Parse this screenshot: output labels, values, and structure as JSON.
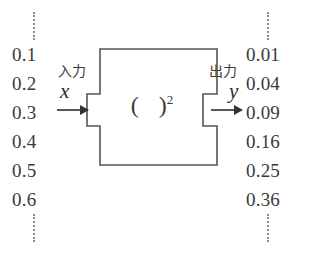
{
  "diagram": {
    "line_color": "#555555",
    "text_color": "#2b2b2b",
    "dot_color": "#8a8a8a",
    "background": "#ffffff"
  },
  "input": {
    "label": "入力",
    "variable": "x",
    "arrow": "right-arrow",
    "dots_above": "vertical-dots",
    "dots_below": "vertical-dots",
    "values": [
      "0.1",
      "0.2",
      "0.3",
      "0.4",
      "0.5",
      "0.6"
    ]
  },
  "output": {
    "label": "出力",
    "variable": "y",
    "arrow": "right-arrow",
    "dots_above": "vertical-dots",
    "dots_below": "vertical-dots",
    "values": [
      "0.01",
      "0.04",
      "0.09",
      "0.16",
      "0.25",
      "0.36"
    ]
  },
  "function_box": {
    "open_paren": "(",
    "close_paren": ")",
    "exponent": "2"
  }
}
